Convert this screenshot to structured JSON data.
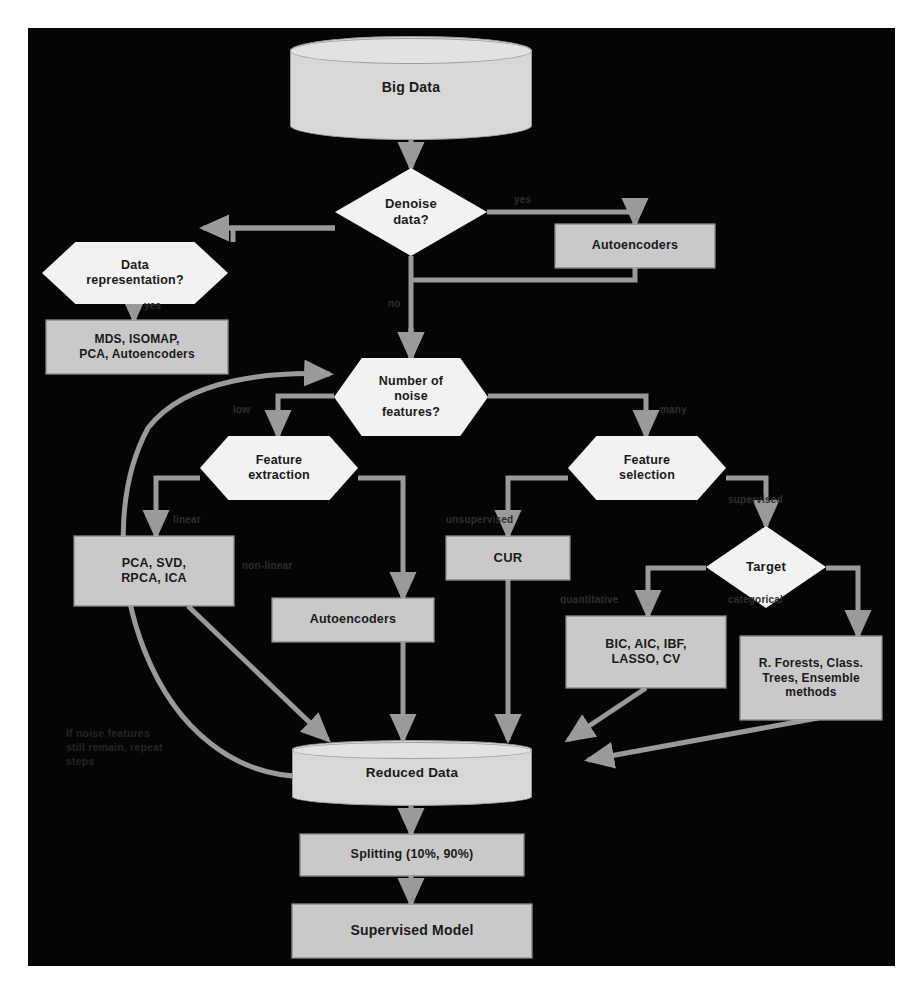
{
  "diagram": {
    "colors": {
      "background": "#050505",
      "page": "#ffffff",
      "process_fill": "#c9c9c9",
      "decision_fill": "#f2f2f2",
      "cylinder_fill": "#d7d7d7",
      "edge": "#9a9a9a",
      "text": "#1a1a1a"
    }
  },
  "nodes": {
    "big_data": {
      "label": "Big Data",
      "shape": "cylinder"
    },
    "denoise": {
      "label": "Denoise\ndata?",
      "line1": "Denoise",
      "line2": "data?",
      "shape": "diamond"
    },
    "autoencoders_top": {
      "label": "Autoencoders",
      "shape": "process"
    },
    "data_representation": {
      "label": "Data\nrepresentation?",
      "line1": "Data",
      "line2": "representation?",
      "shape": "hexagon"
    },
    "mds_isomap": {
      "label": "MDS, ISOMAP,\nPCA, Autoencoders",
      "line1": "MDS, ISOMAP,",
      "line2": "PCA, Autoencoders",
      "shape": "process"
    },
    "noise_features": {
      "label": "Number of\nnoise\nfeatures?",
      "line1": "Number of",
      "line2": "noise",
      "line3": "features?",
      "shape": "hexagon"
    },
    "feature_extraction": {
      "label": "Feature\nextraction",
      "line1": "Feature",
      "line2": "extraction",
      "shape": "hexagon"
    },
    "feature_selection": {
      "label": "Feature\nselection",
      "line1": "Feature",
      "line2": "selection",
      "shape": "hexagon"
    },
    "pca_svd": {
      "label": "PCA, SVD,\nRPCA, ICA",
      "line1": "PCA, SVD,",
      "line2": "RPCA, ICA",
      "shape": "process"
    },
    "autoencoders_mid": {
      "label": "Autoencoders",
      "shape": "process"
    },
    "cur": {
      "label": "CUR",
      "shape": "process"
    },
    "target": {
      "label": "Target",
      "shape": "diamond"
    },
    "bic_aic": {
      "label": "BIC, AIC, IBF,\nLASSO, CV",
      "line1": "BIC, AIC, IBF,",
      "line2": "LASSO, CV",
      "shape": "process"
    },
    "forests": {
      "label": "R. Forests, Class.\nTrees, Ensemble\nmethods",
      "line1": "R. Forests, Class.",
      "line2": "Trees, Ensemble",
      "line3": "methods",
      "shape": "process"
    },
    "reduced_data": {
      "label": "Reduced Data",
      "shape": "cylinder"
    },
    "splitting": {
      "label": "Splitting (10%, 90%)",
      "shape": "process"
    },
    "supervised_model": {
      "label": "Supervised Model",
      "shape": "process"
    }
  },
  "edge_labels": {
    "denoise_yes": "yes",
    "denoise_no": "no",
    "representation_yes": "yes",
    "noise_low": "low",
    "noise_many": "many",
    "extraction_linear": "linear",
    "extraction_nonlinear": "non-linear",
    "selection_unsupervised": "unsupervised",
    "selection_supervised": "supervised",
    "target_quantitative": "quantitative",
    "target_categorical": "categorical"
  },
  "annotations": {
    "feedback_note": "If noise features\nstill remain, repeat\nsteps"
  }
}
